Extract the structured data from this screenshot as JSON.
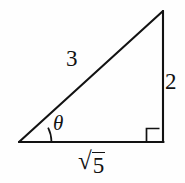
{
  "figure": {
    "kind": "right-triangle-trigonometry-diagram",
    "background_color": "#fefefe",
    "stroke_color": "#121212",
    "stroke_width_px": 2,
    "labels": {
      "hypotenuse": "3",
      "opposite_side": "2",
      "adjacent_side_radical_sign": "√",
      "adjacent_side_radicand": "5",
      "adjacent_side_full": "√5",
      "angle": "θ"
    },
    "geometry": {
      "vertex_left": [
        19,
        142
      ],
      "vertex_bottom_right": [
        163,
        142
      ],
      "vertex_top_right": [
        163,
        11
      ],
      "right_angle_marker_corner": "bottom-right",
      "right_angle_marker_size_px": 13,
      "angle_arc_vertex": "left",
      "angle_arc_radius_px": 32
    }
  }
}
